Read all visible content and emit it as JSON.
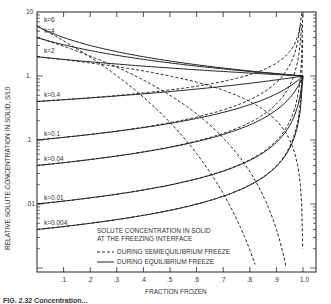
{
  "chart_data": {
    "type": "line",
    "title": "",
    "xlabel": "FRACTION FROZEN",
    "ylabel": "RELATIVE SOLUTE CONCENTRATION IN SOLID, S/L0",
    "xlim": [
      0,
      1.05
    ],
    "ylim": [
      0.001,
      10
    ],
    "yscale": "log",
    "x_ticks": [
      ".1",
      ".2",
      ".3",
      ".4",
      ".5",
      ".6",
      ".7",
      ".8",
      ".9",
      "1.0"
    ],
    "y_ticks": [
      "10",
      "1.",
      ".1",
      ".01"
    ],
    "legend": {
      "title_line1": "SOLUTE CONCENTRATION IN SOLID",
      "title_line2": "AT THE FREEZING INTERFACE",
      "entries": [
        {
          "style": "dashed",
          "label": "DURING SEMIEQUILIBRIUM FREEZE"
        },
        {
          "style": "solid",
          "label": "DURING EQUILIBRIUM FREEZE"
        }
      ]
    },
    "series": [
      {
        "name": "k=6",
        "k": 6,
        "label": "k=6"
      },
      {
        "name": "k=4",
        "k": 4,
        "label": "k=4"
      },
      {
        "name": "k=2",
        "k": 2,
        "label": "k=2"
      },
      {
        "name": "k=0.4",
        "k": 0.4,
        "label": "k=0.4"
      },
      {
        "name": "k=0.1",
        "k": 0.1,
        "label": "k=0.1"
      },
      {
        "name": "k=0.04",
        "k": 0.04,
        "label": "k=0.04"
      },
      {
        "name": "k=0.01",
        "k": 0.01,
        "label": "k=0.01"
      },
      {
        "name": "k=0.004",
        "k": 0.004,
        "label": "k=0.004"
      }
    ],
    "grid": false
  },
  "caption": "FIG. 2.32  Concentration..."
}
